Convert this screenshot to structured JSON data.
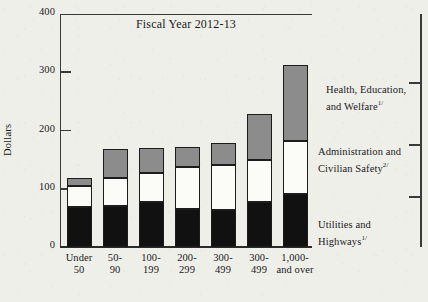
{
  "chart_data": {
    "type": "bar",
    "stacked": true,
    "title": "Fiscal Year 2012-13",
    "xlabel": "",
    "ylabel": "Dollars",
    "ylim": [
      0,
      400
    ],
    "yticks": [
      0,
      100,
      200,
      300,
      400
    ],
    "grid": false,
    "legend_position": "right-inline",
    "categories": [
      "Under\n50",
      "50-\n90",
      "100-\n199",
      "200-\n299",
      "300-\n499",
      "300-\n499",
      "1,000-\nand over"
    ],
    "series": [
      {
        "name": "Utilities and Highways",
        "footnote_marker": "1/",
        "color": "#111111",
        "values": [
          68,
          70,
          77,
          66,
          63,
          78,
          91
        ]
      },
      {
        "name": "Administration and Civilian Safety",
        "footnote_marker": "2/",
        "color": "#fbfbf7",
        "values": [
          37,
          48,
          50,
          72,
          78,
          71,
          91
        ]
      },
      {
        "name": "Health, Education, and Welfare",
        "footnote_marker": "3/",
        "color": "#8c8c8c",
        "values": [
          13,
          51,
          43,
          34,
          37,
          80,
          131
        ]
      }
    ],
    "totals": [
      118,
      169,
      170,
      172,
      178,
      229,
      313
    ]
  },
  "legend": [
    {
      "line1": "Health, Education,",
      "line2": "and Welfare",
      "marker": "1/"
    },
    {
      "line1": "Administration and",
      "line2": "Civilian Safety",
      "marker": "2/"
    },
    {
      "line1": "Utilities and",
      "line2": "Highways",
      "marker": "1/"
    }
  ]
}
